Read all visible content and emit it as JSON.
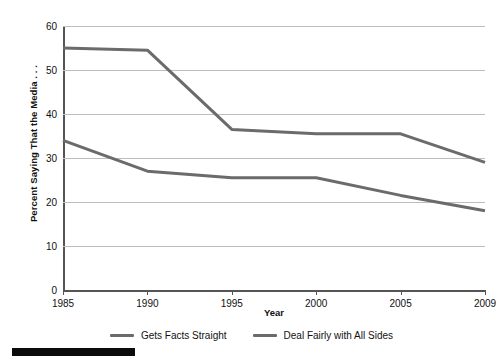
{
  "chart_data": {
    "type": "line",
    "title": "",
    "xlabel": "Year",
    "ylabel": "Percent Saying That the Media . . .",
    "x": [
      1985,
      1990,
      1995,
      2000,
      2005,
      2009
    ],
    "xtick_labels": [
      "1985",
      "1990",
      "1995",
      "2000",
      "2005",
      "2009"
    ],
    "ytick_labels": [
      "0",
      "10",
      "20",
      "30",
      "40",
      "50",
      "60"
    ],
    "yticks": [
      0,
      10,
      20,
      30,
      40,
      50,
      60
    ],
    "ylim": [
      0,
      60
    ],
    "grid": "horizontal",
    "legend_position": "bottom-center",
    "series": [
      {
        "name": "Gets Facts Straight",
        "color": "#6b6b6b",
        "values": [
          34,
          27,
          25.5,
          25.5,
          21.5,
          18
        ]
      },
      {
        "name": "Deal Fairly with All Sides",
        "color": "#6b6b6b",
        "values": [
          55,
          54.5,
          36.5,
          35.5,
          35.5,
          29
        ]
      }
    ]
  },
  "colors": {
    "series_line": "#6b6b6b",
    "gridline": "#bdbdbd",
    "axis": "#555555",
    "text": "#111111",
    "footer_bar": "#0b0b0b"
  }
}
